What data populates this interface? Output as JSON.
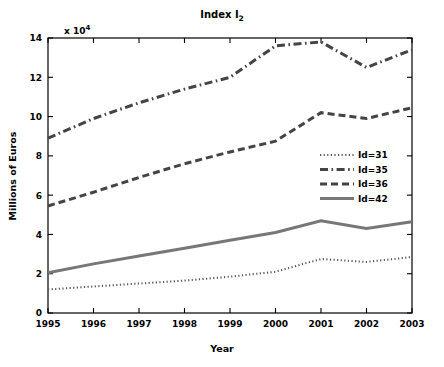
{
  "chart_data": {
    "type": "line",
    "title": "Index I",
    "title_subscript": "2",
    "xlabel": "Year",
    "ylabel": "Millions of Euros",
    "y_multiplier": "x 10",
    "y_multiplier_exponent": "4",
    "categories": [
      1995,
      1996,
      1997,
      1998,
      1999,
      2000,
      2001,
      2002,
      2003
    ],
    "xtick_labels": [
      "1995",
      "1996",
      "1997",
      "1998",
      "1999",
      "2000",
      "2001",
      "2002",
      "2003"
    ],
    "ytick_labels": [
      "0",
      "2",
      "4",
      "6",
      "8",
      "10",
      "12",
      "14"
    ],
    "ytick_values": [
      0,
      2,
      4,
      6,
      8,
      10,
      12,
      14
    ],
    "xlim": [
      1995,
      2003
    ],
    "ylim": [
      0,
      14
    ],
    "grid": false,
    "legend_position": "right-middle",
    "series": [
      {
        "name": "Id=31",
        "dash": "dotted",
        "color": "#555555",
        "values": [
          1.2,
          1.35,
          1.5,
          1.65,
          1.85,
          2.1,
          2.75,
          2.6,
          2.85
        ]
      },
      {
        "name": "Id=35",
        "dash": "dashdot",
        "color": "#444444",
        "values": [
          8.9,
          9.9,
          10.7,
          11.4,
          12.0,
          13.6,
          13.8,
          12.5,
          13.4
        ]
      },
      {
        "name": "Id=36",
        "dash": "dashed",
        "color": "#444444",
        "values": [
          5.45,
          6.15,
          6.9,
          7.6,
          8.2,
          8.75,
          10.2,
          9.9,
          10.45
        ]
      },
      {
        "name": "Id=42",
        "dash": "solid",
        "color": "#777777",
        "values": [
          2.05,
          2.5,
          2.9,
          3.3,
          3.7,
          4.1,
          4.7,
          4.3,
          4.65
        ]
      }
    ]
  },
  "legend": {
    "entries": [
      "Id=31",
      "Id=35",
      "Id=36",
      "Id=42"
    ]
  }
}
